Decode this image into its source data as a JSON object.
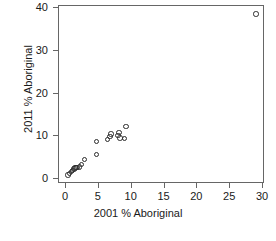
{
  "chart_data": {
    "type": "scatter",
    "title": "",
    "xlabel": "2001 % Aboriginal",
    "ylabel": "2011 % Aboriginal",
    "xlim": [
      0,
      30
    ],
    "ylim": [
      0,
      40
    ],
    "xticks": [
      0,
      5,
      10,
      15,
      20,
      25,
      30
    ],
    "yticks": [
      0,
      10,
      20,
      30,
      40
    ],
    "xticklabels": [
      "0",
      "5",
      "10",
      "15",
      "20",
      "25",
      "30"
    ],
    "yticklabels": [
      "0",
      "10",
      "20",
      "30",
      "40"
    ],
    "grid": false,
    "legend": null,
    "marker": "open-circle",
    "marker_color": "#2b2b2b",
    "points": [
      {
        "x": 0.45,
        "y": 0.7
      },
      {
        "x": 0.7,
        "y": 1.1
      },
      {
        "x": 0.95,
        "y": 1.5
      },
      {
        "x": 1.15,
        "y": 1.8
      },
      {
        "x": 1.35,
        "y": 2.1
      },
      {
        "x": 1.5,
        "y": 2.3
      },
      {
        "x": 1.7,
        "y": 2.4
      },
      {
        "x": 1.85,
        "y": 2.5
      },
      {
        "x": 2.2,
        "y": 2.6
      },
      {
        "x": 2.5,
        "y": 3.1
      },
      {
        "x": 2.95,
        "y": 4.3
      },
      {
        "x": 4.8,
        "y": 5.5
      },
      {
        "x": 4.75,
        "y": 8.5
      },
      {
        "x": 6.5,
        "y": 9.0
      },
      {
        "x": 6.85,
        "y": 9.7
      },
      {
        "x": 7.0,
        "y": 10.3
      },
      {
        "x": 8.05,
        "y": 10.0
      },
      {
        "x": 8.2,
        "y": 10.6
      },
      {
        "x": 8.35,
        "y": 9.4
      },
      {
        "x": 9.05,
        "y": 9.3
      },
      {
        "x": 9.3,
        "y": 12.0
      },
      {
        "x": 29.1,
        "y": 38.4
      }
    ]
  }
}
